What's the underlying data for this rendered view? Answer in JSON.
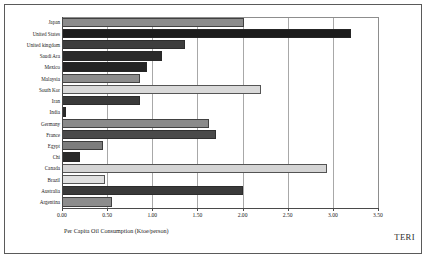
{
  "chart_data": {
    "type": "bar",
    "orientation": "horizontal",
    "title": "",
    "xlabel": "Per Capita Oil Consumption (Ktoe/person)",
    "ylabel": "",
    "xlim": [
      0.0,
      3.5
    ],
    "xticks": [
      "0.00",
      "0.50",
      "1.00",
      "1.50",
      "2.00",
      "2.50",
      "3.00",
      "3.50"
    ],
    "xtick_values": [
      0.0,
      0.5,
      1.0,
      1.5,
      2.0,
      2.5,
      3.0,
      3.5
    ],
    "grid": "vertical",
    "legend": "none",
    "categories": [
      "Japan",
      "United States",
      "United kingdom",
      "Saudi Ara",
      "Mexico",
      "Malaysia",
      "South Kor",
      "Iran",
      "India",
      "Germany",
      "France",
      "Egypt",
      "Chi",
      "Canada",
      "Brazil",
      "Australia",
      "Argentina"
    ],
    "values": [
      2.02,
      3.2,
      1.36,
      1.11,
      0.94,
      0.86,
      2.2,
      0.86,
      0.04,
      1.63,
      1.71,
      0.45,
      0.2,
      2.93,
      0.48,
      2.0,
      0.55
    ],
    "bar_colors": [
      "#8c8c8c",
      "#1c1c1c",
      "#3d3d3d",
      "#2a2a2a",
      "#232323",
      "#8c8c8c",
      "#d9d9d9",
      "#3a3a3a",
      "#2a2a2a",
      "#8a8a8a",
      "#4a4a4a",
      "#7d7d7d",
      "#2a2a2a",
      "#d4d4d4",
      "#e0e0e0",
      "#3a3a3a",
      "#8c8c8c"
    ],
    "annotations": [
      "TERI"
    ]
  },
  "figure": {
    "brand": "TERI",
    "background_color": "#ffffff",
    "frame_color": "#5a5a5a",
    "gridline_color": "#a8a8a8",
    "axis_color": "#4a4a4a"
  }
}
